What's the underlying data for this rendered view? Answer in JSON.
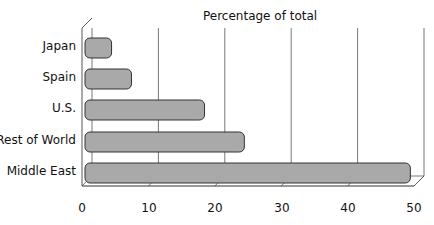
{
  "chart_data": {
    "type": "bar",
    "orientation": "horizontal",
    "style": "3d-cylinder",
    "title": "Percentage of total",
    "xlabel": "",
    "ylabel": "",
    "categories": [
      "Japan",
      "Spain",
      "U.S.",
      "Rest of World",
      "Middle East"
    ],
    "values": [
      4,
      7,
      18,
      24,
      49
    ],
    "xlim": [
      0,
      50
    ],
    "xticks": [
      "0",
      "10",
      "20",
      "30",
      "40",
      "50"
    ],
    "grid": true,
    "legend": null,
    "bar_color": "#a9a9a9"
  }
}
